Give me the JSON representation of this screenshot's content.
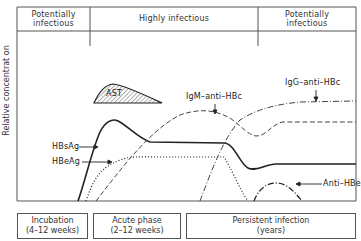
{
  "header": {
    "phases": [
      {
        "line1": "Potentially",
        "line2": "infectious"
      },
      {
        "line1": "Highly infectious",
        "line2": ""
      },
      {
        "line1": "Potentially",
        "line2": "infectious"
      }
    ]
  },
  "axis": {
    "ylabel": "Relative concentrat on"
  },
  "curve_labels": {
    "ast": "AST",
    "hbsag": "HBsAg",
    "hbeag": "HBeAg",
    "igm_anti_hbc": "IgM–anti–HBc",
    "igg_anti_hbc": "IgG–anti–HBc",
    "anti_hbe": "Anti–HBe"
  },
  "stages": [
    {
      "line1": "Incubation",
      "line2": "(4–12 weeks)"
    },
    {
      "line1": "Acute phase",
      "line2": "(2–12 weeks)"
    },
    {
      "line1": "Persistent infection",
      "line2": "(years)"
    }
  ],
  "colors": {
    "line": "#222222",
    "frame": "#555555",
    "background": "#ffffff"
  }
}
